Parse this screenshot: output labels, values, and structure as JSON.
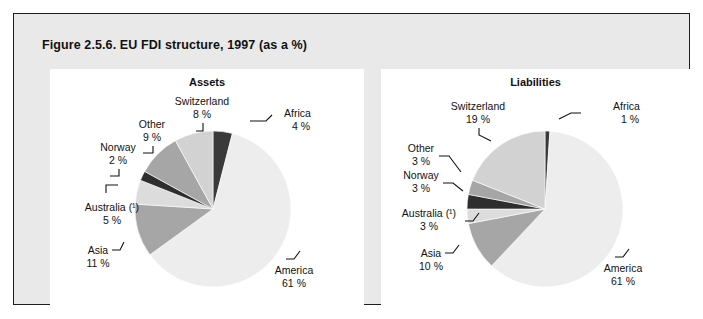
{
  "figure": {
    "title": "Figure 2.5.6. EU FDI structure, 1997 (as a %)",
    "frame_color": "#e9e9e9",
    "border_color": "#1d1d1d",
    "panel_color": "#ffffff"
  },
  "charts": [
    {
      "id": "assets",
      "title": "Assets",
      "center": {
        "x": 163,
        "y": 140
      },
      "radius": 78,
      "labels": [
        {
          "name": "africa",
          "text": "Africa",
          "value_text": "4 %",
          "x": 234,
          "y": 48,
          "anchor": "start",
          "leader": "M 200 52 L 216 52 L 222 46"
        },
        {
          "name": "switzerland",
          "text": "Switzerland",
          "value_text": "8 %",
          "x": 152,
          "y": 36,
          "anchor": "middle",
          "leader": "M 153 54 L 153 62 L 146 62"
        },
        {
          "name": "other",
          "text": "Other",
          "value_text": "9 %",
          "x": 102,
          "y": 59,
          "anchor": "middle",
          "leader": "M 103 77 L 103 84 L 93 84"
        },
        {
          "name": "norway",
          "text": "Norway",
          "value_text": "2 %",
          "x": 68,
          "y": 82,
          "anchor": "middle",
          "leader": "M 69 100 L 69 107 L 60 107"
        },
        {
          "name": "australia",
          "text": "Australia (¹)",
          "value_text": "5 %",
          "x": 62,
          "y": 142,
          "anchor": "middle",
          "leader": "M 56 124 L 56 116 L 68 116"
        },
        {
          "name": "asia",
          "text": "Asia",
          "value_text": "11 %",
          "x": 48,
          "y": 185,
          "anchor": "middle",
          "leader": "M 62 181 L 70 181 L 74 173"
        },
        {
          "name": "america",
          "text": "America",
          "value_text": "61 %",
          "x": 244,
          "y": 205,
          "anchor": "middle",
          "leader": "M 236 190 L 244 190 L 250 182"
        }
      ]
    },
    {
      "id": "liabilities",
      "title": "Liabilities",
      "center": {
        "x": 164,
        "y": 140
      },
      "radius": 78,
      "labels": [
        {
          "name": "africa",
          "text": "Africa",
          "value_text": "1 %",
          "x": 232,
          "y": 41,
          "anchor": "start",
          "leader": "M 178 50 L 190 44 L 200 44"
        },
        {
          "name": "switzerland",
          "text": "Switzerland",
          "value_text": "19 %",
          "x": 97,
          "y": 41,
          "anchor": "middle",
          "leader": "M 98 59 L 98 66 L 110 72"
        },
        {
          "name": "other",
          "text": "Other",
          "value_text": "3 %",
          "x": 40,
          "y": 83,
          "anchor": "middle",
          "leader": "M 58 87 L 68 87 L 80 103"
        },
        {
          "name": "norway",
          "text": "Norway",
          "value_text": "3 %",
          "x": 40,
          "y": 110,
          "anchor": "middle",
          "leader": "M 62 114 L 72 114 L 82 122"
        },
        {
          "name": "australia",
          "text": "Australia (¹)",
          "value_text": "3 %",
          "x": 48,
          "y": 148,
          "anchor": "middle",
          "leader": "M 84 152 L 92 152 L 98 144"
        },
        {
          "name": "asia",
          "text": "Asia",
          "value_text": "10 %",
          "x": 50,
          "y": 188,
          "anchor": "middle",
          "leader": "M 64 184 L 72 184 L 78 176"
        },
        {
          "name": "america",
          "text": "America",
          "value_text": "61 %",
          "x": 242,
          "y": 203,
          "anchor": "middle",
          "leader": "M 234 188 L 242 188 L 248 180"
        }
      ]
    }
  ],
  "chart_data": [
    {
      "type": "pie",
      "id": "assets",
      "title": "Assets",
      "unit": "%",
      "start_angle_deg": 0,
      "direction": "clockwise",
      "categories": [
        "Africa",
        "America",
        "Asia",
        "Australia (¹)",
        "Norway",
        "Other",
        "Switzerland"
      ],
      "values": [
        4,
        61,
        11,
        5,
        2,
        9,
        8
      ],
      "colors": [
        "#3a3a3a",
        "#ededed",
        "#a6a6a6",
        "#dcdcdc",
        "#2e2e2e",
        "#a6a6a6",
        "#d2d2d2"
      ],
      "labels": [
        "4 %",
        "61 %",
        "11 %",
        "5 %",
        "2 %",
        "9 %",
        "8 %"
      ],
      "legend": "none"
    },
    {
      "type": "pie",
      "id": "liabilities",
      "title": "Liabilities",
      "unit": "%",
      "start_angle_deg": 0,
      "direction": "clockwise",
      "categories": [
        "Africa",
        "America",
        "Asia",
        "Australia (¹)",
        "Norway",
        "Other",
        "Switzerland"
      ],
      "values": [
        1,
        61,
        10,
        3,
        3,
        3,
        19
      ],
      "colors": [
        "#3a3a3a",
        "#ededed",
        "#a6a6a6",
        "#dcdcdc",
        "#2e2e2e",
        "#a6a6a6",
        "#d2d2d2"
      ],
      "labels": [
        "1 %",
        "61 %",
        "10 %",
        "3 %",
        "3 %",
        "3 %",
        "19 %"
      ],
      "legend": "none"
    }
  ]
}
